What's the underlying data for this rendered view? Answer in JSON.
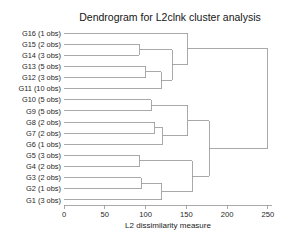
{
  "chart_data": {
    "type": "dendrogram",
    "title": "Dendrogram for L2clnk cluster analysis",
    "xlabel": "L2 dissimilarity measure",
    "ylabel": "",
    "xlim": [
      0,
      255
    ],
    "xticks": [
      0,
      50,
      100,
      150,
      200,
      250
    ],
    "xtick_labels": [
      "0",
      "50",
      "100",
      "150",
      "200",
      "250"
    ],
    "grid": false,
    "legend": "none",
    "orientation": "horizontal",
    "leaves": [
      {
        "label": "G16 (1 obs)",
        "group": "G16",
        "obs": 1
      },
      {
        "label": "G15 (2 obs)",
        "group": "G15",
        "obs": 2
      },
      {
        "label": "G14 (3 obs)",
        "group": "G14",
        "obs": 3
      },
      {
        "label": "G13 (5 obs)",
        "group": "G13",
        "obs": 5
      },
      {
        "label": "G12 (3 obs)",
        "group": "G12",
        "obs": 3
      },
      {
        "label": "G11 (10 obs)",
        "group": "G11",
        "obs": 10
      },
      {
        "label": "G10 (5 obs)",
        "group": "G10",
        "obs": 5
      },
      {
        "label": "G9 (5 obs)",
        "group": "G9",
        "obs": 5
      },
      {
        "label": "G8 (2 obs)",
        "group": "G8",
        "obs": 2
      },
      {
        "label": "G7 (2 obs)",
        "group": "G7",
        "obs": 2
      },
      {
        "label": "G6 (1 obs)",
        "group": "G6",
        "obs": 1
      },
      {
        "label": "G5 (3 obs)",
        "group": "G5",
        "obs": 3
      },
      {
        "label": "G4 (2 obs)",
        "group": "G4",
        "obs": 2
      },
      {
        "label": "G3 (2 obs)",
        "group": "G3",
        "obs": 2
      },
      {
        "label": "G2 (1 obs)",
        "group": "G2",
        "obs": 1
      },
      {
        "label": "G1 (3 obs)",
        "group": "G1",
        "obs": 3
      }
    ],
    "merges": [
      {
        "id": "m1",
        "children": [
          "G15",
          "G14"
        ],
        "height": 92
      },
      {
        "id": "m2",
        "children": [
          "G13",
          "G12"
        ],
        "height": 100
      },
      {
        "id": "m3",
        "children": [
          "m2",
          "G11"
        ],
        "height": 119
      },
      {
        "id": "m4",
        "children": [
          "m1",
          "m3"
        ],
        "height": 133
      },
      {
        "id": "m5",
        "children": [
          "G16",
          "m4"
        ],
        "height": 151
      },
      {
        "id": "m6",
        "children": [
          "G10",
          "G9"
        ],
        "height": 107
      },
      {
        "id": "m7",
        "children": [
          "G8",
          "G7"
        ],
        "height": 111
      },
      {
        "id": "m8",
        "children": [
          "m7",
          "G6"
        ],
        "height": 121
      },
      {
        "id": "m9",
        "children": [
          "m6",
          "m8"
        ],
        "height": 152
      },
      {
        "id": "m10",
        "children": [
          "G5",
          "G4"
        ],
        "height": 92
      },
      {
        "id": "m11",
        "children": [
          "G3",
          "G2"
        ],
        "height": 95
      },
      {
        "id": "m12",
        "children": [
          "m11",
          "G1"
        ],
        "height": 120
      },
      {
        "id": "m13",
        "children": [
          "m10",
          "m12"
        ],
        "height": 157
      },
      {
        "id": "m14",
        "children": [
          "m9",
          "m13"
        ],
        "height": 178
      },
      {
        "id": "m15",
        "children": [
          "m5",
          "m14"
        ],
        "height": 250
      }
    ],
    "colors": {
      "line": "#9a9a9a",
      "text": "#1a1a1a",
      "background": "#ffffff"
    }
  }
}
